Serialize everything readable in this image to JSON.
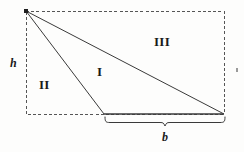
{
  "figure": {
    "background_color": "#fdfdfc",
    "stroke_color": "#3a3a3a",
    "dash_color": "#555555",
    "text_color": "#1a1a1a"
  },
  "labels": {
    "region_one": "I",
    "region_two": "II",
    "region_three": "III",
    "height": "h",
    "base": "b"
  },
  "geometry": {
    "rect": {
      "x": 26,
      "y": 11,
      "width": 198,
      "height": 103
    },
    "apex": {
      "x": 26,
      "y": 11
    },
    "base_left": {
      "x": 104,
      "y": 114
    },
    "base_right": {
      "x": 224,
      "y": 114
    },
    "brace": {
      "x_start": 105,
      "x_end": 225,
      "y": 117,
      "tip_x": 165,
      "depth": 8
    }
  },
  "icons": {
    "apex_vertex": "vertex-dot",
    "right_tick": "edge-tick-mark"
  }
}
